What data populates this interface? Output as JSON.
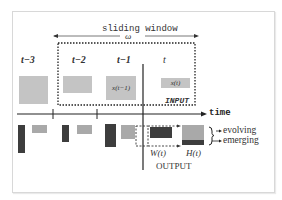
{
  "diagram": {
    "title": "sliding window",
    "window_symbol": "ω",
    "time_steps": [
      "t−3",
      "t−2",
      "t−1",
      "t"
    ],
    "input_labels": {
      "x_t_minus_1": "x(t−1)",
      "x_t": "x(t)",
      "input": "INPUT"
    },
    "axis_label": "time",
    "output_labels": {
      "W": "W(t)",
      "H": "H(t)",
      "output": "OUTPUT"
    },
    "legend": {
      "evolving": "evolving",
      "emerging": "emerging"
    },
    "colors": {
      "light_block": "#c4c4c4",
      "mid_block": "#a9a9a9",
      "dark_block": "#3d3d3d",
      "axis": "#222222",
      "frame_border": "#d8d8d8"
    }
  }
}
